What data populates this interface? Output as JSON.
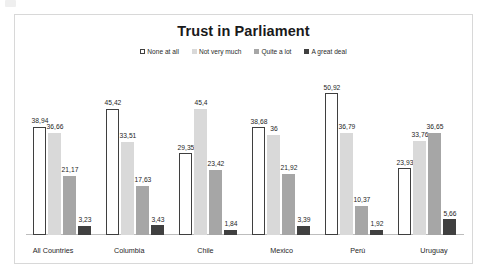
{
  "chart_data": {
    "type": "bar",
    "title": "Trust in Parliament",
    "xlabel": "",
    "ylabel": "",
    "ylim": [
      0,
      55
    ],
    "grid": false,
    "legend_position": "top-center",
    "categories": [
      "All Countries",
      "Columbia",
      "Chile",
      "Mexico",
      "Perú",
      "Uruguay"
    ],
    "series": [
      {
        "name": "None at all",
        "color": "#ffffff",
        "border": "#3f3f3f",
        "values": [
          38.94,
          45.42,
          29.35,
          38.68,
          50.92,
          23.93
        ],
        "labels": [
          "38,94",
          "45,42",
          "29,35",
          "38,68",
          "50,92",
          "23,93"
        ]
      },
      {
        "name": "Not very much",
        "color": "#d9d9d9",
        "border": "#d9d9d9",
        "values": [
          36.66,
          33.51,
          45.4,
          36.0,
          36.79,
          33.76
        ],
        "labels": [
          "36,66",
          "33,51",
          "45,4",
          "36",
          "36,79",
          "33,76"
        ]
      },
      {
        "name": "Quite a lot",
        "color": "#a6a6a6",
        "border": "#a6a6a6",
        "values": [
          21.17,
          17.63,
          23.42,
          21.92,
          10.37,
          36.65
        ],
        "labels": [
          "21,17",
          "17,63",
          "23,42",
          "21,92",
          "10,37",
          "36,65"
        ]
      },
      {
        "name": "A great deal",
        "color": "#404040",
        "border": "#404040",
        "values": [
          3.23,
          3.43,
          1.84,
          3.39,
          1.92,
          5.66
        ],
        "labels": [
          "3,23",
          "3,43",
          "1,84",
          "3,39",
          "1,92",
          "5,66"
        ]
      }
    ]
  }
}
